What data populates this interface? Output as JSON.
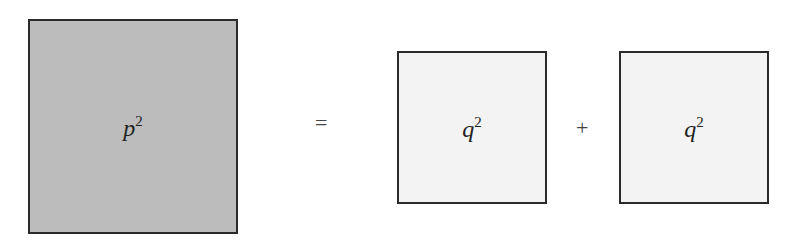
{
  "diagram": {
    "squares": [
      {
        "variable": "p",
        "exponent": "2",
        "fill": "#bcbcbc"
      },
      {
        "variable": "q",
        "exponent": "2",
        "fill": "#f3f3f3"
      },
      {
        "variable": "q",
        "exponent": "2",
        "fill": "#f3f3f3"
      }
    ],
    "operators": {
      "equals": "=",
      "plus": "+"
    }
  }
}
